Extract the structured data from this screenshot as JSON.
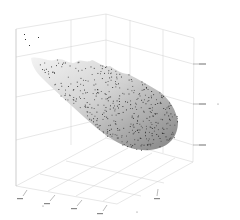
{
  "chart_data": {
    "type": "scatter3d",
    "title": "",
    "xlabel": "x",
    "ylabel": "",
    "zlabel": "z",
    "surface": "translucent grey fitted surface under scatter points",
    "grid": true,
    "legend": null,
    "x_ticks": [
      "-",
      "-",
      "-",
      "-"
    ],
    "y_ticks": [
      "-",
      "-"
    ],
    "z_ticks": [
      "-",
      "-",
      "-"
    ],
    "colors": {
      "points": "#333333",
      "surface_light": "#e6e6e6",
      "surface_dark": "#8a8a8a",
      "grid": "#c8c8c8"
    },
    "note": "Tick label text is illegible at source resolution; data shape: z decreases from high values at far-left corner to a minimum bowl at front-right."
  },
  "scene": {
    "box_back_top": [
      [
        47,
        28
      ],
      [
        215,
        15
      ],
      [
        213,
        135
      ]
    ],
    "outliers": [
      [
        24,
        34
      ],
      [
        38,
        37
      ],
      [
        25,
        39
      ],
      [
        29,
        45
      ]
    ]
  }
}
